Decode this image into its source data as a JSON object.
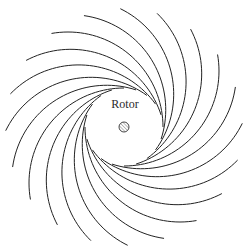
{
  "diagram": {
    "label": "Rotor",
    "center": [
      124,
      127
    ],
    "rotor_radius": 39,
    "hub_radius": 5,
    "arm_count": 20,
    "arm_curve_radius": 95,
    "arm_sweep_degrees": 100,
    "line_color": "#222222",
    "hub_hatch_color": "#777777"
  }
}
